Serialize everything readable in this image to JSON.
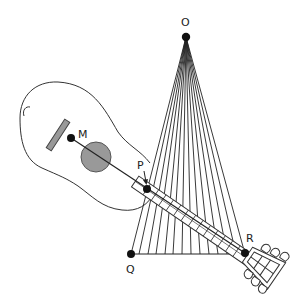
{
  "diagram": {
    "type": "geometry-diagram",
    "labels": {
      "O": "O",
      "M": "M",
      "P": "P",
      "Q": "Q",
      "R": "R"
    },
    "points": {
      "O": [
        186,
        37
      ],
      "M": [
        71,
        138
      ],
      "P": [
        147,
        189
      ],
      "Q": [
        131,
        254
      ],
      "R": [
        245,
        253
      ]
    },
    "fan_line_count": 14,
    "colors": {
      "stroke": "#222222",
      "soundhole_fill": "#999999",
      "saddle_fill": "#999999",
      "background": "#ffffff"
    }
  }
}
